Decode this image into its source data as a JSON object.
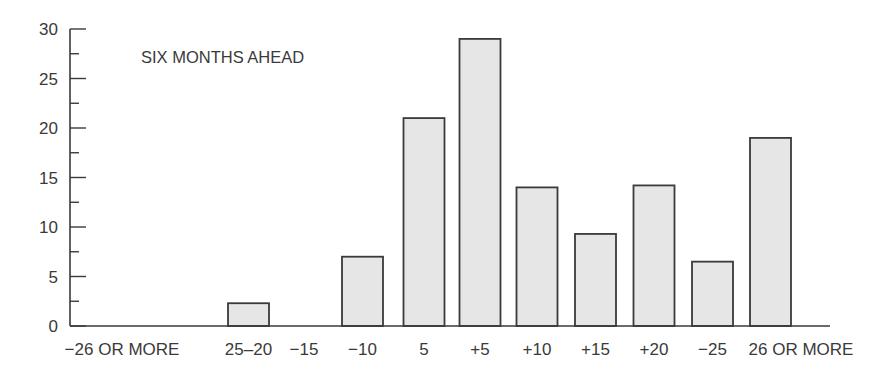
{
  "chart_data": {
    "type": "bar",
    "title": "SIX MONTHS AHEAD",
    "xlabel": "",
    "ylabel": "",
    "categories": [
      "−26 OR MORE",
      "25–20",
      "−15",
      "−10",
      "5",
      "+5",
      "+10",
      "+15",
      "+20",
      "−25",
      "26 OR MORE"
    ],
    "values": [
      0,
      2.3,
      0,
      7,
      21,
      29,
      14,
      9.3,
      14.2,
      6.5,
      19
    ],
    "ylim": [
      0,
      30
    ],
    "yticks": [
      0,
      5,
      10,
      15,
      20,
      25,
      30
    ],
    "minor_ytick_step": 2.5,
    "grid": false,
    "legend": null,
    "bar_fill": "#e6e6e6",
    "bar_stroke": "#3a3a3a"
  }
}
